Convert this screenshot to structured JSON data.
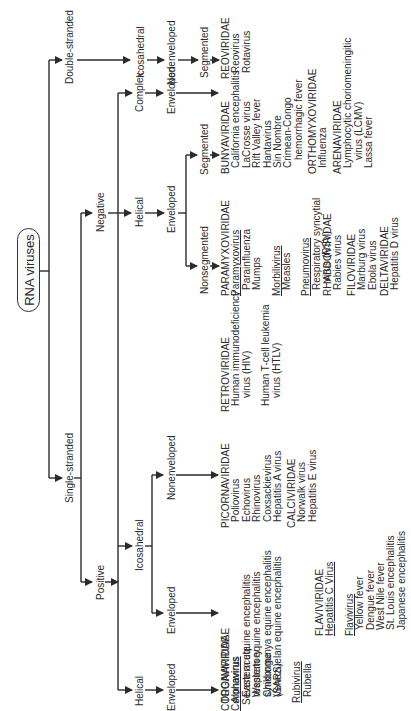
{
  "root": "RNA viruses",
  "branches": {
    "double_stranded": "Double-stranded",
    "single_stranded": "Single-stranded",
    "negative": "Negative",
    "positive": "Positive",
    "ds_icosahedral": "Icosahedral",
    "ds_nonenveloped": "Nonenveloped",
    "ds_segmented": "Segmented",
    "neg_helical": "Helical",
    "neg_enveloped": "Enveloped",
    "neg_nonsegmented": "Nonsegmented",
    "neg_segmented": "Segmented",
    "pos_complex": "Complex",
    "pos_complex_enveloped": "Enveloped",
    "pos_icosahedral": "Icosahedral",
    "pos_ico_nonenveloped": "Nonenveloped",
    "pos_ico_enveloped": "Enveloped",
    "pos_helical": "Helical",
    "pos_helical_enveloped": "Enveloped"
  },
  "families": {
    "reoviridae": {
      "name": "REOVIRIDAE",
      "members": [
        "Reovirus",
        "Rotavirus"
      ]
    },
    "bunyaviridae": {
      "name": "BUNYAVIRIDAE",
      "members": [
        "California encephalitis",
        "LaCrosse virus",
        "Rift Valley fever",
        "Hantavirus",
        "Sin Nombre",
        "Crimean-Congo",
        "hemorrhagic fever"
      ]
    },
    "orthomyxoviridae": {
      "name": "ORTHOMYXOVIRIDAE",
      "members": [
        "Influenza"
      ]
    },
    "arenaviridae": {
      "name": "ARENAVIRIDAE",
      "members": [
        "Lymphocytic choriomeningitic",
        "virus (LCMV)",
        "Lassa fever"
      ]
    },
    "paramyxoviridae": {
      "name": "PARAMYXOVIRIDAE",
      "genus1": "Paramyxovirus",
      "g1_members": [
        "Parainfluenza",
        "Mumps"
      ],
      "genus2": "Morbilivirus",
      "g2_members": [
        "Measles"
      ],
      "genus3": "Pneumovirus",
      "g3_members": [
        "Respiratory syncytial",
        "virus (RSV)"
      ]
    },
    "rhabdoviridae": {
      "name": "RHABDOVIRIDAE",
      "members": [
        "Rabies virus"
      ]
    },
    "filoviridae": {
      "name": "FILOVIRIDAE",
      "members": [
        "Marburg virus",
        "Ebola virus"
      ]
    },
    "deltaviridae": {
      "name": "DELTAVIRIDAE",
      "members": [
        "Hepatitis D virus"
      ]
    },
    "retroviridae": {
      "name": "RETROVIRIDAE",
      "members": [
        "Human immunodeficiency",
        "virus (HIV)",
        "Human T-cell leukemia",
        "virus (HTLV)"
      ]
    },
    "picornaviridae": {
      "name": "PICORNAVIRIDAE",
      "members": [
        "Poliovirus",
        "Echovirus",
        "Rhinovirus",
        "Coxsackievirus",
        "Hepatitis A virus"
      ]
    },
    "calciviridae": {
      "name": "CALCIVIRIDAE",
      "members": [
        "Norwalk virus",
        "Hepatitis E virus"
      ]
    },
    "togaviridae": {
      "name": "TOGAVIRIDAE",
      "genus1": "Alphavirus",
      "g1_members": [
        "Eastern equine encephalitis",
        "Western equine encephalitis",
        "Chikungunya equine encephalitis",
        "Venezuelan equine encephalitis"
      ],
      "genus2": "Rubivirus",
      "g2_members": [
        "Rubella"
      ]
    },
    "flaviviridae": {
      "name": "FLAVIVIRIDAE",
      "genus1": "Hepatitis C Virus",
      "genus2": "Flavivirus",
      "g2_members": [
        "Yellow fever",
        "Dengue fever",
        "West Nile fever",
        "St. Louis encephalitis",
        "Japanese encephalitis"
      ]
    },
    "coronaviridae": {
      "name": "CORONAVIRIDAE",
      "genus1": "Coronavirus",
      "g1_members": [
        "Severe acute",
        "respiratory",
        "syndrome",
        "(SARS)"
      ]
    }
  },
  "colors": {
    "line": "#2b2b2b",
    "text": "#2a2a2a",
    "box_fill": "#fafafa"
  }
}
